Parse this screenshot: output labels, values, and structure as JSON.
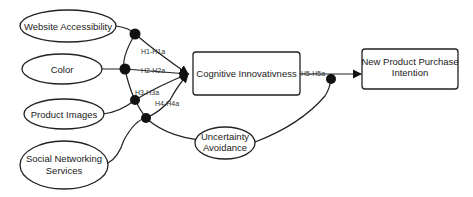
{
  "diagram": {
    "nodes": {
      "website_accessibility": "Website Accessibility",
      "color": "Color",
      "product_images": "Product Images",
      "social_networking_line1": "Social Networking",
      "social_networking_line2": "Services",
      "cognitive_innovativeness": "Cognitive Innovativness",
      "uncertainty_line1": "Uncertainty",
      "uncertainty_line2": "Avoidance",
      "purchase_intention_line1": "New Product Purchase",
      "purchase_intention_line2": "Intention"
    },
    "edges": {
      "h1": "H1-H1a",
      "h2": "H2-H2a",
      "h3": "H3-H3a",
      "h4": "H4-H4a",
      "h5": "H5-H5a"
    },
    "colors": {
      "stroke": "#222222",
      "background": "#ffffff"
    }
  }
}
